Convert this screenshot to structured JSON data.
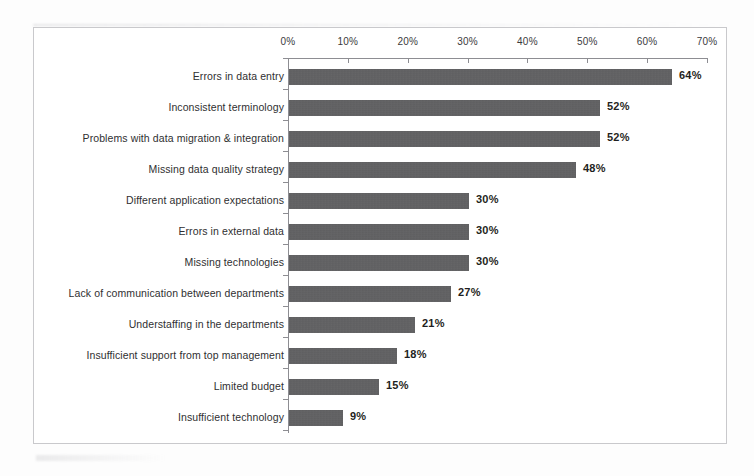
{
  "chart_data": {
    "type": "bar",
    "orientation": "horizontal",
    "title": "",
    "xlabel": "",
    "ylabel": "",
    "xlim": [
      0,
      70
    ],
    "grid": false,
    "legend": null,
    "xtick_labels": [
      "0%",
      "10%",
      "20%",
      "30%",
      "40%",
      "50%",
      "60%",
      "70%"
    ],
    "xticks": [
      0,
      10,
      20,
      30,
      40,
      50,
      60,
      70
    ],
    "categories": [
      "Errors in data entry",
      "Inconsistent terminology",
      "Problems with data migration & integration",
      "Missing data quality strategy",
      "Different application expectations",
      "Errors in external data",
      "Missing technologies",
      "Lack of communication between departments",
      "Understaffing in the departments",
      "Insufficient support from top management",
      "Limited budget",
      "Insufficient technology"
    ],
    "values": [
      64,
      52,
      52,
      48,
      30,
      30,
      30,
      27,
      21,
      18,
      15,
      9
    ],
    "value_labels": [
      "64%",
      "52%",
      "52%",
      "48%",
      "30%",
      "30%",
      "30%",
      "27%",
      "21%",
      "18%",
      "15%",
      "9%"
    ],
    "bar_color": "#5b5b5d",
    "frame_color": "#c9c9cc",
    "axis_color": "#8d8d92"
  }
}
